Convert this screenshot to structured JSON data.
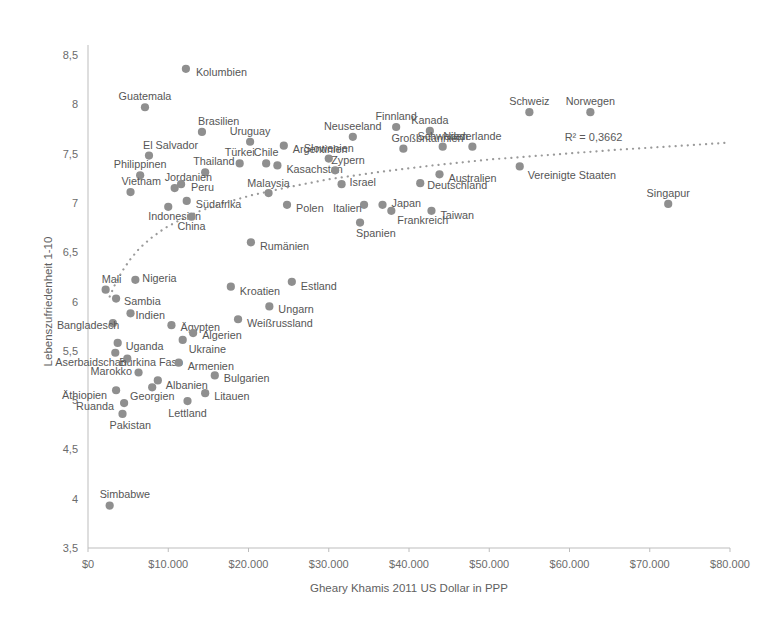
{
  "chart_data": {
    "type": "scatter",
    "title": "",
    "xlabel": "Gheary Khamis 2011 US Dollar in PPP",
    "ylabel": "Lebenszufriedenheit 1-10",
    "xlim": [
      0,
      80000
    ],
    "ylim": [
      3.5,
      8.5
    ],
    "xticks": [
      0,
      10000,
      20000,
      30000,
      40000,
      50000,
      60000,
      70000,
      80000
    ],
    "xticklabels": [
      "$0",
      "$10.000",
      "$20.000",
      "$30.000",
      "$40.000",
      "$50.000",
      "$60.000",
      "$70.000",
      "$80.000"
    ],
    "yticks": [
      3.5,
      4,
      4.5,
      5,
      5.5,
      6,
      6.5,
      7,
      7.5,
      8,
      8.5
    ],
    "yticklabels": [
      "3,5",
      "4",
      "4,5",
      "5",
      "5,5",
      "6",
      "6,5",
      "7",
      "7,5",
      "8",
      "8,5"
    ],
    "grid": false,
    "legend": null,
    "annotations": [
      {
        "name": "r-squared",
        "text": "R² = 0,3662",
        "x": 63000,
        "y": 7.63
      }
    ],
    "trendline": {
      "type": "logarithmic",
      "r_squared": 0.3662,
      "label": "R² = 0,3662",
      "style": "dotted",
      "color": "#9a9a9a",
      "points": [
        {
          "x": 2700,
          "y": 6.05
        },
        {
          "x": 3400,
          "y": 6.18
        },
        {
          "x": 4200,
          "y": 6.3
        },
        {
          "x": 5200,
          "y": 6.42
        },
        {
          "x": 6400,
          "y": 6.54
        },
        {
          "x": 7800,
          "y": 6.64
        },
        {
          "x": 9500,
          "y": 6.74
        },
        {
          "x": 11500,
          "y": 6.83
        },
        {
          "x": 14000,
          "y": 6.92
        },
        {
          "x": 17000,
          "y": 7.0
        },
        {
          "x": 20500,
          "y": 7.08
        },
        {
          "x": 25000,
          "y": 7.16
        },
        {
          "x": 30000,
          "y": 7.24
        },
        {
          "x": 36000,
          "y": 7.31
        },
        {
          "x": 43000,
          "y": 7.38
        },
        {
          "x": 50000,
          "y": 7.44
        },
        {
          "x": 58000,
          "y": 7.49
        },
        {
          "x": 66000,
          "y": 7.54
        },
        {
          "x": 74000,
          "y": 7.58
        },
        {
          "x": 79500,
          "y": 7.61
        }
      ]
    },
    "marker_color": "#8f8f8f",
    "points": [
      {
        "label": "Kolumbien",
        "x": 12200,
        "y": 8.36,
        "lx": 10,
        "ly": 3
      },
      {
        "label": "Guatemala",
        "x": 7100,
        "y": 7.97,
        "lx": -2,
        "ly": -11
      },
      {
        "label": "Brasilien",
        "x": 14200,
        "y": 7.72,
        "lx": -4,
        "ly": -11
      },
      {
        "label": "El Salvador",
        "x": 7600,
        "y": 7.48,
        "lx": -6,
        "ly": -11
      },
      {
        "label": "Uruguay",
        "x": 20200,
        "y": 7.62,
        "lx": 0,
        "ly": -11
      },
      {
        "label": "Argentinien",
        "x": 24400,
        "y": 7.58,
        "lx": 9,
        "ly": 3
      },
      {
        "label": "Finnland",
        "x": 38400,
        "y": 7.77,
        "lx": -2,
        "ly": -11
      },
      {
        "label": "Neuseeland",
        "x": 33000,
        "y": 7.67,
        "lx": -2,
        "ly": -11
      },
      {
        "label": "Kanada",
        "x": 42600,
        "y": 7.73,
        "lx": -2,
        "ly": -11
      },
      {
        "label": "Schweiz",
        "x": 55000,
        "y": 7.92,
        "lx": 0,
        "ly": -11
      },
      {
        "label": "Norwegen",
        "x": 62600,
        "y": 7.92,
        "lx": 0,
        "ly": -11
      },
      {
        "label": "Schweden",
        "x": 44200,
        "y": 7.57,
        "lx": -2,
        "ly": -11
      },
      {
        "label": "Niederlande",
        "x": 47900,
        "y": 7.57,
        "lx": 0,
        "ly": -11
      },
      {
        "label": "Großbritannien",
        "x": 39300,
        "y": 7.55,
        "lx": -12,
        "ly": -11
      },
      {
        "label": "Slowenien",
        "x": 30000,
        "y": 7.45,
        "lx": -2,
        "ly": -11
      },
      {
        "label": "Vereinigte Staaten",
        "x": 53800,
        "y": 7.37,
        "lx": 8,
        "ly": 9
      },
      {
        "label": "Kasachstan",
        "x": 23600,
        "y": 7.38,
        "lx": 9,
        "ly": 4
      },
      {
        "label": "Zypern",
        "x": 30800,
        "y": 7.33,
        "lx": -4,
        "ly": -10
      },
      {
        "label": "Australien",
        "x": 43800,
        "y": 7.29,
        "lx": 9,
        "ly": 4
      },
      {
        "label": "Israel",
        "x": 31600,
        "y": 7.19,
        "lx": 8,
        "ly": -2
      },
      {
        "label": "Deutschland",
        "x": 41400,
        "y": 7.2,
        "lx": 7,
        "ly": 2
      },
      {
        "label": "Türkei",
        "x": 18900,
        "y": 7.4,
        "lx": -2,
        "ly": -11
      },
      {
        "label": "Chile",
        "x": 22200,
        "y": 7.4,
        "lx": -2,
        "ly": -11
      },
      {
        "label": "Thailand",
        "x": 14600,
        "y": 7.31,
        "lx": -12,
        "ly": -11
      },
      {
        "label": "Philippinen",
        "x": 6500,
        "y": 7.28,
        "lx": 3,
        "ly": -11
      },
      {
        "label": "Jordanien",
        "x": 10800,
        "y": 7.15,
        "lx": -10,
        "ly": -11
      },
      {
        "label": "Peru",
        "x": 11600,
        "y": 7.19,
        "lx": 10,
        "ly": 3
      },
      {
        "label": "Vietnam",
        "x": 5300,
        "y": 7.11,
        "lx": -9,
        "ly": -11
      },
      {
        "label": "Malaysia",
        "x": 22500,
        "y": 7.1,
        "lx": -3,
        "ly": -10
      },
      {
        "label": "Südafrika",
        "x": 12300,
        "y": 7.02,
        "lx": 9,
        "ly": 3
      },
      {
        "label": "Japan",
        "x": 36700,
        "y": 6.98,
        "lx": 9,
        "ly": -2
      },
      {
        "label": "Italien",
        "x": 34400,
        "y": 6.98,
        "lx": -31,
        "ly": 3
      },
      {
        "label": "Frankreich",
        "x": 37800,
        "y": 6.92,
        "lx": 6,
        "ly": 9
      },
      {
        "label": "Taiwan",
        "x": 42800,
        "y": 6.92,
        "lx": 9,
        "ly": 4
      },
      {
        "label": "Polen",
        "x": 24800,
        "y": 6.98,
        "lx": 9,
        "ly": 3
      },
      {
        "label": "Singapur",
        "x": 72300,
        "y": 6.99,
        "lx": 0,
        "ly": -11
      },
      {
        "label": "Indonesien",
        "x": 10000,
        "y": 6.96,
        "lx": -20,
        "ly": 9
      },
      {
        "label": "China",
        "x": 12900,
        "y": 6.86,
        "lx": -3,
        "ly": 9
      },
      {
        "label": "Spanien",
        "x": 33900,
        "y": 6.8,
        "lx": -4,
        "ly": 10
      },
      {
        "label": "Rumänien",
        "x": 20300,
        "y": 6.6,
        "lx": 9,
        "ly": 4
      },
      {
        "label": "Estland",
        "x": 25400,
        "y": 6.2,
        "lx": 9,
        "ly": 4
      },
      {
        "label": "Kroatien",
        "x": 17800,
        "y": 6.15,
        "lx": 9,
        "ly": 4
      },
      {
        "label": "Nigeria",
        "x": 5900,
        "y": 6.22,
        "lx": 7,
        "ly": -2
      },
      {
        "label": "Mali",
        "x": 2200,
        "y": 6.12,
        "lx": -4,
        "ly": -11
      },
      {
        "label": "Sambia",
        "x": 3500,
        "y": 6.03,
        "lx": 8,
        "ly": 2
      },
      {
        "label": "Ungarn",
        "x": 22600,
        "y": 5.95,
        "lx": 9,
        "ly": 3
      },
      {
        "label": "Weißrussland",
        "x": 18700,
        "y": 5.82,
        "lx": 9,
        "ly": 4
      },
      {
        "label": "Indien",
        "x": 5300,
        "y": 5.88,
        "lx": 5,
        "ly": 2
      },
      {
        "label": "Bangladesch",
        "x": 3100,
        "y": 5.78,
        "lx": -56,
        "ly": 2
      },
      {
        "label": "Ägypten",
        "x": 10400,
        "y": 5.76,
        "lx": 9,
        "ly": 2
      },
      {
        "label": "Algerien",
        "x": 13100,
        "y": 5.68,
        "lx": 9,
        "ly": 2
      },
      {
        "label": "Uganda",
        "x": 3700,
        "y": 5.58,
        "lx": 8,
        "ly": 3
      },
      {
        "label": "Ukraine",
        "x": 11800,
        "y": 5.61,
        "lx": 6,
        "ly": 9
      },
      {
        "label": "Burkina Faso",
        "x": 3400,
        "y": 5.48,
        "lx": 4,
        "ly": 9
      },
      {
        "label": "Aserbaidschan",
        "x": 4900,
        "y": 5.42,
        "lx": -72,
        "ly": 3
      },
      {
        "label": "Armenien",
        "x": 11300,
        "y": 5.38,
        "lx": 9,
        "ly": 3
      },
      {
        "label": "Marokko",
        "x": 6300,
        "y": 5.28,
        "lx": -48,
        "ly": -1
      },
      {
        "label": "Albanien",
        "x": 8700,
        "y": 5.2,
        "lx": 8,
        "ly": 5
      },
      {
        "label": "Bulgarien",
        "x": 15800,
        "y": 5.25,
        "lx": 9,
        "ly": 3
      },
      {
        "label": "Äthiopien",
        "x": 3500,
        "y": 5.1,
        "lx": -54,
        "ly": 5
      },
      {
        "label": "Georgien",
        "x": 8000,
        "y": 5.13,
        "lx": 3,
        "ly": 9
      },
      {
        "label": "Litauen",
        "x": 14600,
        "y": 5.07,
        "lx": 9,
        "ly": 3
      },
      {
        "label": "Lettland",
        "x": 12400,
        "y": 4.99,
        "lx": 3,
        "ly": 12
      },
      {
        "label": "Ruanda",
        "x": 4500,
        "y": 4.97,
        "lx": -48,
        "ly": 3
      },
      {
        "label": "Pakistan",
        "x": 4300,
        "y": 4.86,
        "lx": -13,
        "ly": 11
      },
      {
        "label": "Simbabwe",
        "x": 2700,
        "y": 3.93,
        "lx": -10,
        "ly": -12
      }
    ]
  }
}
